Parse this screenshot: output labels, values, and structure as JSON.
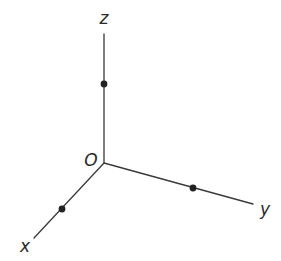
{
  "diagram": {
    "type": "3d-coordinate-axes",
    "origin": {
      "label": "O",
      "pos": [
        104,
        163
      ]
    },
    "axes": [
      {
        "name": "x",
        "label": "x",
        "end": [
          34,
          238
        ],
        "label_pos": [
          25,
          252
        ],
        "point": [
          62,
          209
        ]
      },
      {
        "name": "y",
        "label": "y",
        "end": [
          253,
          204
        ],
        "label_pos": [
          265,
          215
        ],
        "point": [
          193,
          188
        ]
      },
      {
        "name": "z",
        "label": "z",
        "end": [
          104,
          34
        ],
        "label_pos": [
          104,
          24
        ],
        "point": [
          104,
          84
        ]
      }
    ],
    "colors": {
      "line": "#3a3a3a",
      "point": "#222222",
      "text": "#2a2a2a",
      "background": "#ffffff"
    }
  }
}
